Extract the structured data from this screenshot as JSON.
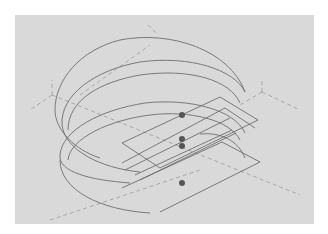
{
  "viewport": {
    "background": "#d9d9d9",
    "line_color": "#6e6e6e",
    "dash_color": "#9a9a9a",
    "point_color": "#555555"
  },
  "drawing": {
    "type": "isometric wireframe",
    "description": "Three stacked partial circular arcs (C-shaped ring segments) with a flat bracket/tab through the middle and dashed axis guides",
    "points": [
      {
        "x": 182,
        "y": 115
      },
      {
        "x": 182,
        "y": 139
      },
      {
        "x": 182,
        "y": 146
      },
      {
        "x": 182,
        "y": 183
      }
    ]
  }
}
